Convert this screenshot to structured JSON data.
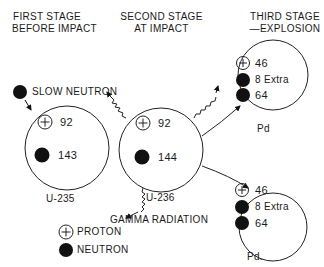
{
  "stages": [
    {
      "title_line1": "FIRST STAGE",
      "title_line2": "BEFORE IMPACT"
    },
    {
      "title_line1": "SECOND STAGE",
      "title_line2": "AT IMPACT"
    },
    {
      "title_line1": "THIRD STAGE",
      "title_line2": "—EXPLOSION"
    }
  ],
  "incoming": {
    "label": "SLOW NEUTRON"
  },
  "nuclei": [
    {
      "id": "u235",
      "label": "U-235",
      "protons": "92",
      "neutrons": "143"
    },
    {
      "id": "u236",
      "label": "U-236",
      "protons": "92",
      "neutrons": "144"
    },
    {
      "id": "pd1",
      "label": "Pd",
      "protons": "46",
      "extra_neutrons": "8 Extra",
      "neutrons": "64"
    },
    {
      "id": "pd2",
      "label": "Pd.",
      "protons": "46",
      "extra_neutrons": "8 Extra",
      "neutrons": "64"
    }
  ],
  "emission": {
    "label": "GAMMA RADIATION"
  },
  "legend": {
    "items": [
      {
        "symbol": "proton-icon",
        "label": "PROTON"
      },
      {
        "symbol": "neutron-icon",
        "label": "NEUTRON"
      }
    ]
  },
  "colors": {
    "ink": "#111111",
    "paper": "#ffffff"
  }
}
